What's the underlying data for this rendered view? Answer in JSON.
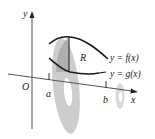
{
  "diagram": {
    "type": "washer-method-solid-of-revolution",
    "axes": {
      "x_label": "x",
      "y_label": "y",
      "origin_label": "O"
    },
    "ticks": [
      {
        "label": "a"
      },
      {
        "label": "b"
      }
    ],
    "curves": [
      {
        "name": "upper",
        "label": "y = f(x)"
      },
      {
        "name": "lower",
        "label": "y = g(x)"
      }
    ],
    "region_label": "R",
    "colors": {
      "curve": "#1a1a1a",
      "axis": "#444444",
      "washer": "#c8c8c8",
      "washer_dark": "#a9a9a9",
      "text": "#222222"
    }
  }
}
